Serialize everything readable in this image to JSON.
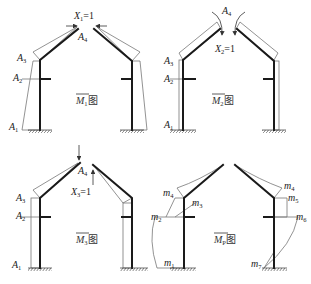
{
  "figure": {
    "panels": [
      {
        "id": "M1",
        "title_symbol": "M",
        "title_sub": "1",
        "title_suffix": "图",
        "load_label": "X",
        "load_sub": "1",
        "load_value": "=1",
        "node_labels": [
          {
            "text": "A",
            "sub": "1"
          },
          {
            "text": "A",
            "sub": "2"
          },
          {
            "text": "A",
            "sub": "3"
          },
          {
            "text": "A",
            "sub": "4"
          }
        ]
      },
      {
        "id": "M2",
        "title_symbol": "M",
        "title_sub": "2",
        "title_suffix": "图",
        "load_label": "X",
        "load_sub": "2",
        "load_value": "=1",
        "node_labels": [
          {
            "text": "A",
            "sub": "1"
          },
          {
            "text": "A",
            "sub": "2"
          },
          {
            "text": "A",
            "sub": "3"
          },
          {
            "text": "A",
            "sub": "4"
          }
        ]
      },
      {
        "id": "M3",
        "title_symbol": "M",
        "title_sub": "3",
        "title_suffix": "图",
        "load_label": "X",
        "load_sub": "3",
        "load_value": "=1",
        "node_labels": [
          {
            "text": "A",
            "sub": "1"
          },
          {
            "text": "A",
            "sub": "2"
          },
          {
            "text": "A",
            "sub": "3"
          },
          {
            "text": "A",
            "sub": "4"
          }
        ]
      },
      {
        "id": "MP",
        "title_symbol": "M",
        "title_sub": "P",
        "title_suffix": "图",
        "moment_labels": [
          {
            "text": "m",
            "sub": "1"
          },
          {
            "text": "m",
            "sub": "2"
          },
          {
            "text": "m",
            "sub": "3"
          },
          {
            "text": "m",
            "sub": "4"
          },
          {
            "text": "m",
            "sub": "4"
          },
          {
            "text": "m",
            "sub": "5"
          },
          {
            "text": "m",
            "sub": "6"
          },
          {
            "text": "m",
            "sub": "7"
          }
        ]
      }
    ]
  }
}
